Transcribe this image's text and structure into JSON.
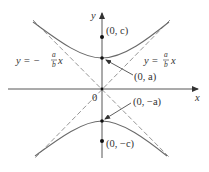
{
  "figure": {
    "type": "hyperbola-diagram",
    "equation_form": "y^2/a^2 - x^2/b^2 = 1",
    "colors": {
      "axis": "#444444",
      "curve": "#6a6a6a",
      "asymptote": "#8a8a8a",
      "point": "#111111",
      "text": "#333333"
    },
    "axes": {
      "x_label": "x",
      "y_label": "y",
      "origin_label": "0"
    },
    "asymptotes": [
      {
        "name": "negative",
        "label_lhs": "y = −",
        "frac_num": "a",
        "frac_den": "b",
        "label_var": "x"
      },
      {
        "name": "positive",
        "label_lhs": "y = ",
        "frac_num": "a",
        "frac_den": "b",
        "label_var": "x"
      }
    ],
    "points": [
      {
        "name": "focus-top",
        "label": "(0, c)"
      },
      {
        "name": "vertex-top",
        "label": "(0, a)"
      },
      {
        "name": "vertex-bottom",
        "label": "(0, −a)"
      },
      {
        "name": "focus-bottom",
        "label": "(0, −c)"
      }
    ]
  }
}
